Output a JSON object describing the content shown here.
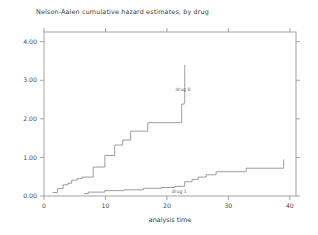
{
  "chart_data": {
    "type": "line",
    "subtype": "step-function",
    "title": "Nelson-Aalen cumulative hazard estimates, by drug",
    "xlabel": "analysis time",
    "ylabel": "",
    "xlim": [
      0,
      41
    ],
    "ylim": [
      0,
      4.25
    ],
    "xticks": [
      0,
      10,
      20,
      30,
      40
    ],
    "xtick_labels": [
      "0",
      "10",
      "20",
      "30",
      "40"
    ],
    "yticks": [
      0.0,
      1.0,
      2.0,
      3.0,
      4.0
    ],
    "ytick_labels": [
      "0.00",
      "1.00",
      "2.00",
      "3.00",
      "4.00"
    ],
    "grid": false,
    "legend": "inline-annotations",
    "line_color": "#8c8c8c",
    "frame_color": "#9a9a9a",
    "series": [
      {
        "name": "drug 0",
        "label": "drug 0",
        "label_x": 22.6,
        "label_y": 2.72,
        "x": [
          1.4,
          1.4,
          2.2,
          2.2,
          3.1,
          3.1,
          3.9,
          3.9,
          4.5,
          4.5,
          5.4,
          5.4,
          6.2,
          6.2,
          8.0,
          8.0,
          9.9,
          9.9,
          11.5,
          11.5,
          12.8,
          12.8,
          14.1,
          14.1,
          16.9,
          16.9,
          22.4,
          22.4,
          22.8,
          22.8,
          22.9
        ],
        "y": [
          0.09,
          0.09,
          0.19,
          0.19,
          0.29,
          0.29,
          0.33,
          0.33,
          0.41,
          0.41,
          0.45,
          0.45,
          0.49,
          0.49,
          0.75,
          0.75,
          1.05,
          1.05,
          1.32,
          1.32,
          1.45,
          1.45,
          1.68,
          1.68,
          1.9,
          1.9,
          2.38,
          2.38,
          2.42,
          2.42,
          3.4
        ],
        "values_note": "cumulative hazard step estimates for drug 0"
      },
      {
        "name": "drug 1",
        "label": "drug 1",
        "label_x": 22.0,
        "label_y": 0.07,
        "x": [
          6.5,
          6.5,
          7.2,
          7.2,
          9.9,
          9.9,
          13.0,
          13.0,
          16.2,
          16.2,
          19.1,
          19.1,
          21.3,
          21.3,
          22.9,
          22.9,
          24.1,
          24.1,
          25.1,
          25.1,
          26.4,
          26.4,
          28.0,
          28.0,
          32.9,
          32.9,
          39.0
        ],
        "y": [
          0.06,
          0.06,
          0.1,
          0.1,
          0.14,
          0.14,
          0.16,
          0.16,
          0.2,
          0.2,
          0.22,
          0.22,
          0.25,
          0.25,
          0.37,
          0.37,
          0.43,
          0.43,
          0.49,
          0.49,
          0.55,
          0.55,
          0.63,
          0.63,
          0.72,
          0.72,
          0.95
        ],
        "values_note": "cumulative hazard step estimates for drug 1"
      }
    ]
  }
}
